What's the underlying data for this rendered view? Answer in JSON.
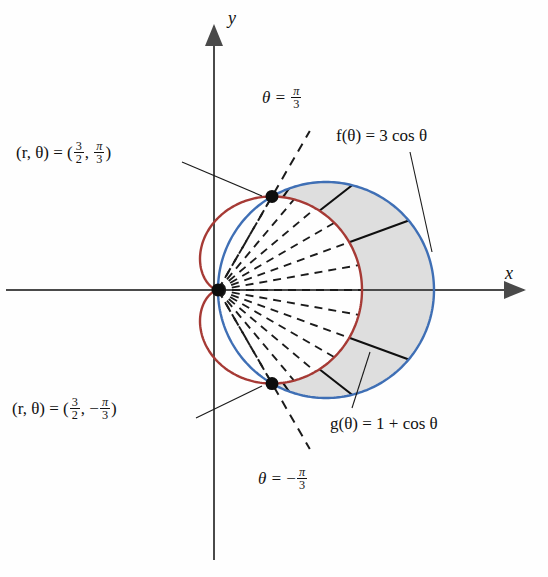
{
  "figure": {
    "kind": "polar-area-diagram",
    "axes": {
      "x_label": "x",
      "y_label": "y"
    },
    "curves": [
      {
        "name": "circle",
        "label": "f(θ) = 3 cos θ",
        "equation": "r = 3 cos θ",
        "color": "#3f6fb5",
        "max_r": 3
      },
      {
        "name": "cardioid",
        "label": "g(θ) = 1 + cos θ",
        "equation": "r = 1 + cos θ",
        "color": "#a63a35",
        "max_r": 2
      }
    ],
    "points": [
      {
        "name": "upper-intersection",
        "label_prefix": "(r, θ) = (",
        "r_num": "3",
        "r_den": "2",
        "theta_num": "π",
        "theta_den": "3",
        "theta_sign": "",
        "r": 1.5,
        "theta_deg": 60
      },
      {
        "name": "lower-intersection",
        "label_prefix": "(r, θ) = (",
        "r_num": "3",
        "r_den": "2",
        "theta_num": "π",
        "theta_den": "3",
        "theta_sign": "−",
        "r": 1.5,
        "theta_deg": -60
      }
    ],
    "rays": [
      {
        "name": "upper-ray",
        "prefix": "θ = ",
        "sign": "",
        "num": "π",
        "den": "3",
        "theta_deg": 60
      },
      {
        "name": "lower-ray",
        "prefix": "θ = ",
        "sign": "−",
        "num": "π",
        "den": "3",
        "theta_deg": -60
      }
    ],
    "shaded_region": {
      "name": "area-between-curves",
      "fill": "#dcdcdc",
      "theta_from_deg": -60,
      "theta_to_deg": 60,
      "outer": "3 cos θ",
      "inner": "1 + cos θ"
    },
    "colors": {
      "axis": "#4a4a4a",
      "circle": "#3f6fb5",
      "cardioid": "#a63a35",
      "shade": "#dcdcdc",
      "ink": "#121212"
    }
  },
  "chart_data": {
    "type": "line",
    "title": "",
    "xlabel": "x",
    "ylabel": "y",
    "coordinate_system": "polar",
    "origin_px": [
      218,
      290
    ],
    "scale_px_per_unit": 72,
    "series": [
      {
        "name": "f(θ) = 3 cos θ",
        "equation": "r = 3 cos θ",
        "color": "#3f6fb5",
        "theta_deg": [
          -90,
          -75,
          -60,
          -45,
          -30,
          -15,
          0,
          15,
          30,
          45,
          60,
          75,
          90
        ],
        "r": [
          0,
          0.776,
          1.5,
          2.121,
          2.598,
          2.898,
          3,
          2.898,
          2.598,
          2.121,
          1.5,
          0.776,
          0
        ]
      },
      {
        "name": "g(θ) = 1 + cos θ",
        "equation": "r = 1 + cos θ",
        "color": "#a63a35",
        "theta_deg": [
          0,
          30,
          60,
          90,
          120,
          150,
          180,
          210,
          240,
          270,
          300,
          330,
          360
        ],
        "r": [
          2,
          1.866,
          1.5,
          1,
          0.5,
          0.134,
          0,
          0.134,
          0.5,
          1,
          1.5,
          1.866,
          2
        ]
      }
    ],
    "marked_points": [
      {
        "label": "(r, θ) = (3/2, π/3)",
        "r": 1.5,
        "theta_deg": 60
      },
      {
        "label": "(r, θ) = (3/2, -π/3)",
        "r": 1.5,
        "theta_deg": -60
      }
    ],
    "annotations": [
      "θ = π/3",
      "θ = -π/3",
      "f(θ) = 3 cos θ",
      "g(θ) = 1 + cos θ"
    ],
    "grid": false,
    "legend": "none"
  }
}
